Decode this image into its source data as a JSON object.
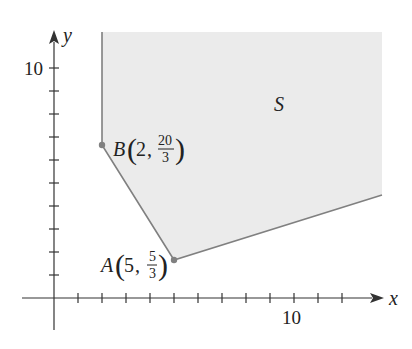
{
  "figure": {
    "region_label": "S",
    "axes": {
      "x_label": "x",
      "y_label": "y",
      "x_tick_label": "10",
      "y_tick_label": "10",
      "x_ticks": [
        1,
        2,
        3,
        4,
        5,
        6,
        7,
        8,
        9,
        10,
        11,
        12,
        13
      ],
      "y_ticks": [
        1,
        2,
        3,
        4,
        5,
        6,
        7,
        8,
        9,
        10
      ]
    },
    "points": [
      {
        "name": "B",
        "x": "2",
        "y_num": "20",
        "y_den": "3"
      },
      {
        "name": "A",
        "x": "5",
        "y_num": "5",
        "y_den": "3"
      }
    ],
    "colors": {
      "region_fill": "#ebebeb",
      "boundary": "#808080",
      "axis": "#333333",
      "text": "#222222"
    }
  }
}
